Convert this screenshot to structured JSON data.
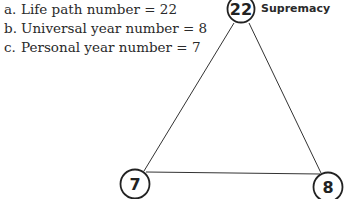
{
  "list": [
    {
      "marker": "a.",
      "text": "Life path number = 22"
    },
    {
      "marker": "b.",
      "text": "Universal year number = 8"
    },
    {
      "marker": "c.",
      "text": "Personal year number = 7"
    }
  ],
  "nodes": {
    "top": {
      "label": "22",
      "annotation": "Supremacy"
    },
    "bottom_left": {
      "label": "7"
    },
    "bottom_right": {
      "label": "8"
    }
  }
}
